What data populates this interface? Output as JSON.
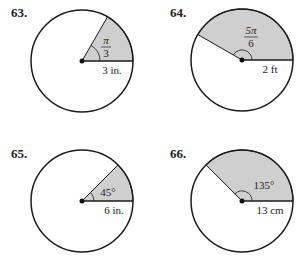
{
  "problems": [
    {
      "number": "63.",
      "angle_label_num": "π",
      "angle_label_den": "3",
      "radius_label": "3 in.",
      "angle_deg": 60
    },
    {
      "number": "64.",
      "angle_label_num": "5π",
      "angle_label_den": "6",
      "radius_label": "2 ft",
      "angle_deg": 150
    },
    {
      "number": "65.",
      "angle_label": "45°",
      "radius_label": "6 in.",
      "angle_deg": 45
    },
    {
      "number": "66.",
      "angle_label": "135°",
      "radius_label": "13 cm",
      "angle_deg": 135
    }
  ],
  "colors": {
    "sector_fill": "#cfcfcf",
    "stroke": "#1a1a1a"
  }
}
